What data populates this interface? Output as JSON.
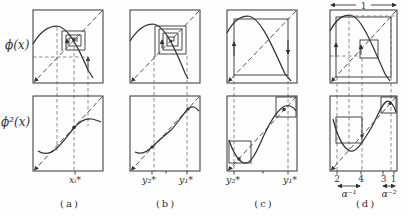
{
  "figure": {
    "colors": {
      "ink": "#333333",
      "guide": "#666666",
      "bg": "#fdfdfd"
    },
    "row_labels": {
      "phi": "ϕ(x)",
      "phi2": "ϕ²(x)"
    },
    "panels": [
      {
        "id": "a",
        "caption": "(a)",
        "ticks": [
          "xᵢ*"
        ]
      },
      {
        "id": "b",
        "caption": "(b)",
        "ticks": [
          "y₂*",
          "y₁*"
        ]
      },
      {
        "id": "c",
        "caption": "(c)",
        "ticks": [
          "y₂*",
          "y₁*"
        ]
      },
      {
        "id": "d",
        "caption": "(d)",
        "ticks": [
          "2",
          "4",
          "3",
          "1"
        ],
        "width_label": "1",
        "scales": [
          "α⁻¹",
          "α⁻²"
        ]
      }
    ]
  }
}
